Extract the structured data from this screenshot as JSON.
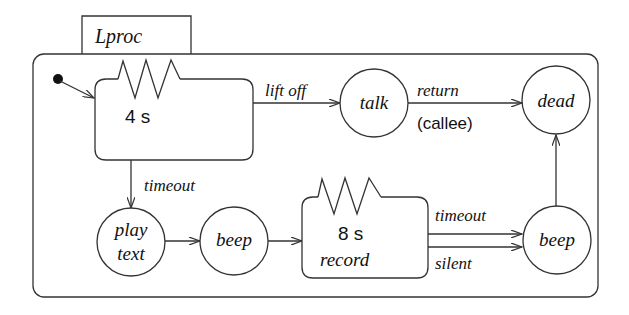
{
  "diagram": {
    "type": "statechart",
    "container": {
      "label": "Lproc"
    },
    "states": {
      "wait": {
        "timer": "4 s",
        "label": ""
      },
      "talk": {
        "label": "talk"
      },
      "dead": {
        "label": "dead"
      },
      "play": {
        "line1": "play",
        "line2": "text"
      },
      "beep1": {
        "label": "beep"
      },
      "record": {
        "timer": "8 s",
        "label": "record"
      },
      "beep2": {
        "label": "beep"
      }
    },
    "transitions": {
      "lift_off": {
        "label": "lift off"
      },
      "return": {
        "label": "return",
        "sublabel": "(callee)"
      },
      "timeout1": {
        "label": "timeout"
      },
      "timeout2": {
        "label": "timeout"
      },
      "silent": {
        "label": "silent"
      }
    }
  }
}
